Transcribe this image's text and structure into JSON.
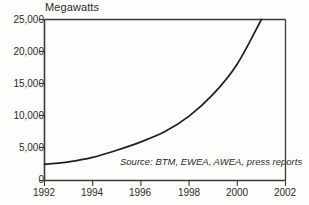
{
  "chart_data": {
    "type": "line",
    "title": "Megawatts",
    "ylabel": "Megawatts",
    "xlabel": "",
    "xlim": [
      1992,
      2002
    ],
    "ylim": [
      0,
      25000
    ],
    "grid": false,
    "legend": "none",
    "x": [
      1992,
      1993,
      1994,
      1995,
      1996,
      1997,
      1998,
      1999,
      2000,
      2001
    ],
    "values": [
      2500,
      2900,
      3600,
      4700,
      6000,
      7600,
      10000,
      13400,
      18100,
      25000
    ],
    "series": [
      {
        "name": "Cumulative wind generating capacity",
        "values": [
          2500,
          2900,
          3600,
          4700,
          6000,
          7600,
          10000,
          13400,
          18100,
          25000
        ]
      }
    ],
    "ytick_labels": [
      "0",
      "5,000",
      "10,000",
      "15,000",
      "20,000",
      "25,000"
    ],
    "ytick_values": [
      0,
      5000,
      10000,
      15000,
      20000,
      25000
    ],
    "xtick_labels": [
      "1992",
      "1994",
      "1996",
      "1998",
      "2000",
      "2002"
    ],
    "xtick_values": [
      1992,
      1994,
      1996,
      1998,
      2000,
      2002
    ],
    "annotations": [
      {
        "name": "source-note",
        "text": "Source: BTM, EWEA, AWEA, press reports"
      }
    ],
    "colors": {
      "line": "#1f1f1f",
      "axis": "#3b3b3b",
      "background": "#fdfdfc",
      "text": "#2b2b2b"
    }
  },
  "axis_title": "Megawatts",
  "source_note": "Source: BTM, EWEA, AWEA, press reports",
  "yticks": [
    "25,000",
    "20,000",
    "15,000",
    "10,000",
    "5,000",
    "0"
  ],
  "xticks": [
    "1992",
    "1994",
    "1996",
    "1998",
    "2000",
    "2002"
  ]
}
